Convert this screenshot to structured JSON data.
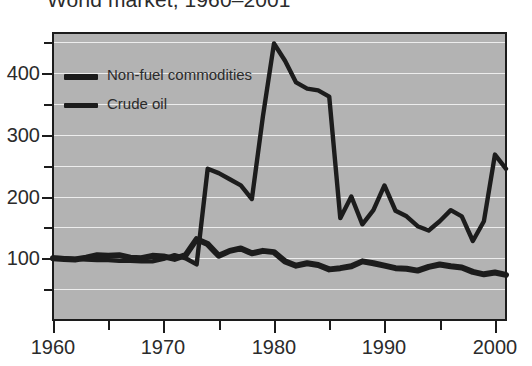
{
  "title": "World market, 1960–2001",
  "axes": {
    "y_labels": [
      "100",
      "200",
      "300",
      "400"
    ],
    "y_values": [
      100,
      200,
      300,
      400
    ],
    "y_minor_values": [
      50,
      150,
      250,
      350,
      450
    ],
    "x_labels": [
      "1960",
      "1970",
      "1980",
      "1990",
      "2000"
    ],
    "x_values": [
      1960,
      1970,
      1980,
      1990,
      2000
    ],
    "x_minor_values": [
      1965,
      1975,
      1985,
      1995
    ]
  },
  "legend": {
    "items": [
      {
        "label": "Non-fuel commodities",
        "swatch": "thick-line-swatch"
      },
      {
        "label": "Crude oil",
        "swatch": "thin-line-swatch"
      }
    ]
  },
  "colors": {
    "plot_background": "#b3b3b3",
    "gridline": "#ededed",
    "axis": "#1c1c1c",
    "series": "#1c1c1c",
    "page_background": "#ffffff",
    "text": "#2b2b2b"
  },
  "chart_data": {
    "type": "line",
    "title": "World market, 1960–2001",
    "xlabel": "",
    "ylabel": "",
    "xlim": [
      1960,
      2001
    ],
    "ylim": [
      0,
      465
    ],
    "grid": "horizontal",
    "legend_position": "inside-top-left",
    "x": [
      1960,
      1961,
      1962,
      1963,
      1964,
      1965,
      1966,
      1967,
      1968,
      1969,
      1970,
      1971,
      1972,
      1973,
      1974,
      1975,
      1976,
      1977,
      1978,
      1979,
      1980,
      1981,
      1982,
      1983,
      1984,
      1985,
      1986,
      1987,
      1988,
      1989,
      1990,
      1991,
      1992,
      1993,
      1994,
      1995,
      1996,
      1997,
      1998,
      1999,
      2000,
      2001
    ],
    "series": [
      {
        "name": "Non-fuel commodities",
        "values": [
          100,
          99,
          98,
          101,
          105,
          104,
          105,
          101,
          100,
          104,
          103,
          99,
          105,
          131,
          123,
          104,
          112,
          116,
          108,
          112,
          110,
          95,
          88,
          92,
          89,
          82,
          84,
          87,
          95,
          92,
          88,
          84,
          83,
          80,
          86,
          90,
          87,
          85,
          78,
          74,
          77,
          73
        ]
      },
      {
        "name": "Crude oil",
        "values": [
          101,
          100,
          99,
          98,
          97,
          97,
          96,
          96,
          95,
          95,
          99,
          105,
          100,
          90,
          245,
          238,
          228,
          218,
          196,
          330,
          448,
          420,
          385,
          375,
          372,
          362,
          165,
          200,
          155,
          178,
          218,
          177,
          168,
          152,
          145,
          160,
          178,
          168,
          128,
          160,
          268,
          245
        ]
      }
    ]
  }
}
